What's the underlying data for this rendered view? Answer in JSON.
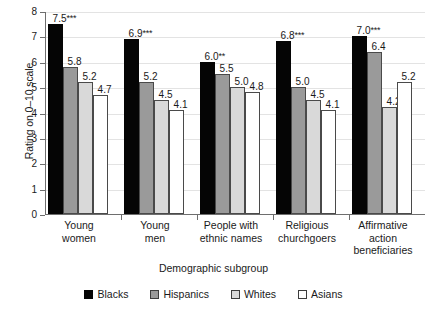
{
  "chart_data": {
    "type": "bar",
    "title": "",
    "xlabel": "Demographic subgroup",
    "ylabel": "Rating on 0–10 scale",
    "ylim": [
      0,
      8
    ],
    "yticks": [
      "0",
      "1",
      "2",
      "3",
      "4",
      "5",
      "6",
      "7",
      "8"
    ],
    "grid": true,
    "legend_position": "bottom",
    "categories": [
      "Young women",
      "Young men",
      "People with ethnic names",
      "Religious churchgoers",
      "Affirmative action beneficiaries"
    ],
    "category_lines": [
      [
        "Young",
        "women"
      ],
      [
        "Young",
        "men"
      ],
      [
        "People with",
        "ethnic names"
      ],
      [
        "Religious",
        "churchgoers"
      ],
      [
        "Affirmative",
        "action",
        "beneficiaries"
      ]
    ],
    "series": [
      {
        "name": "Blacks",
        "color": "#050505",
        "values": [
          7.5,
          6.9,
          6.0,
          6.8,
          7.0
        ],
        "labels": [
          "7.5",
          "6.9",
          "6.0",
          "6.8",
          "7.0"
        ],
        "stars": [
          "***",
          "***",
          "**",
          "***",
          "***"
        ]
      },
      {
        "name": "Hispanics",
        "color": "#9a9a9a",
        "values": [
          5.8,
          5.2,
          5.5,
          5.0,
          6.4
        ],
        "labels": [
          "5.8",
          "5.2",
          "5.5",
          "5.0",
          "6.4"
        ],
        "stars": [
          "",
          "",
          "",
          "",
          ""
        ]
      },
      {
        "name": "Whites",
        "color": "#d9d9d9",
        "values": [
          5.2,
          4.5,
          5.0,
          4.5,
          4.2
        ],
        "labels": [
          "5.2",
          "4.5",
          "5.0",
          "4.5",
          "4.2"
        ],
        "stars": [
          "",
          "",
          "",
          "",
          ""
        ]
      },
      {
        "name": "Asians",
        "color": "#ffffff",
        "values": [
          4.7,
          4.1,
          4.8,
          4.1,
          5.2
        ],
        "labels": [
          "4.7",
          "4.1",
          "4.8",
          "4.1",
          "5.2"
        ],
        "stars": [
          "",
          "",
          "",
          "",
          ""
        ]
      }
    ]
  }
}
